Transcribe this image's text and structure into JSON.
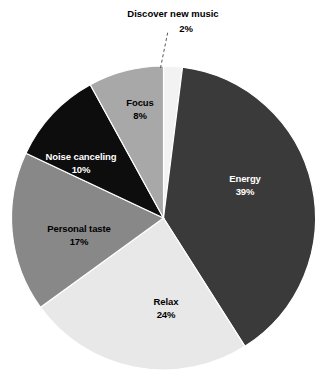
{
  "chart_data": {
    "type": "pie",
    "title": "",
    "subtitle": "",
    "xlabel": "",
    "ylabel": "",
    "grid": false,
    "legend_position": "none",
    "labels_inside_slices": true,
    "value_suffix": "%",
    "total": 100,
    "start_angle_deg": 0,
    "direction": "clockwise",
    "categories": [
      "Discover new music",
      "Energy",
      "Relax",
      "Personal taste",
      "Noise canceling",
      "Focus"
    ],
    "values": [
      2,
      39,
      24,
      17,
      10,
      8
    ],
    "slices": [
      {
        "label": "Discover new music",
        "value": 2,
        "value_text": "2%",
        "color": "#f2f2f2",
        "text_color": "#000000",
        "label_placement": "callout",
        "leader_line": true
      },
      {
        "label": "Energy",
        "value": 39,
        "value_text": "39%",
        "color": "#3a3a3a",
        "text_color": "#ffffff",
        "label_placement": "inside",
        "leader_line": false
      },
      {
        "label": "Relax",
        "value": 24,
        "value_text": "24%",
        "color": "#e8e8e8",
        "text_color": "#000000",
        "label_placement": "inside",
        "leader_line": false
      },
      {
        "label": "Personal taste",
        "value": 17,
        "value_text": "17%",
        "color": "#888888",
        "text_color": "#000000",
        "label_placement": "inside",
        "leader_line": false
      },
      {
        "label": "Noise canceling",
        "value": 10,
        "value_text": "10%",
        "color": "#0d0d0d",
        "text_color": "#ffffff",
        "label_placement": "inside",
        "leader_line": false
      },
      {
        "label": "Focus",
        "value": 8,
        "value_text": "8%",
        "color": "#a8a8a8",
        "text_color": "#000000",
        "label_placement": "inside",
        "leader_line": false
      }
    ],
    "background_color": "#ffffff",
    "slice_border_color": "#ffffff"
  }
}
